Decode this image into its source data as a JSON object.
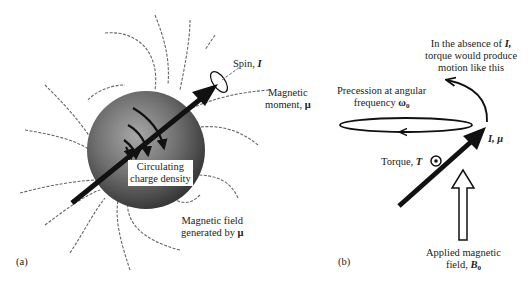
{
  "panel_a": {
    "label": "(a)",
    "spin": {
      "text": "Spin, ",
      "symbol": "I"
    },
    "magnetic_moment": {
      "line1": "Magnetic",
      "line2_text": "moment, ",
      "symbol": "μ"
    },
    "charge_density": {
      "line1": "Circulating",
      "line2": "charge density"
    },
    "field": {
      "line1": "Magnetic field",
      "line2_text": "generated by ",
      "symbol": "μ"
    }
  },
  "panel_b": {
    "label": "(b)",
    "absence": {
      "line1_text": "In the absence of ",
      "line1_symbol": "I,",
      "line2": "torque would produce",
      "line3": "motion like this"
    },
    "precession": {
      "line1": "Precession at angular",
      "line2_text": "frequency ",
      "symbol": "ω",
      "subscript": "0"
    },
    "vector_label": {
      "symbol": "I, μ"
    },
    "torque": {
      "text": "Torque, ",
      "symbol": "T"
    },
    "applied_field": {
      "line1": "Applied magnetic",
      "line2_text": "field, ",
      "symbol": "B",
      "subscript": "0"
    }
  },
  "colors": {
    "ink": "#111111",
    "sphere_light": "#9a9a9a",
    "sphere_dark": "#3a3a3a",
    "field_line": "#555555"
  }
}
